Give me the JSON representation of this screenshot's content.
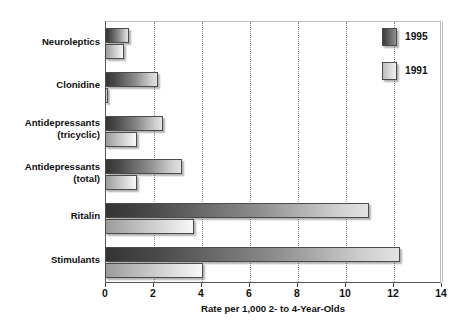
{
  "chart_data": {
    "type": "bar",
    "orientation": "horizontal",
    "title": "",
    "xlabel": "Rate per 1,000 2- to 4-Year-Olds",
    "ylabel": "",
    "xlim": [
      0,
      14
    ],
    "xticks": [
      0,
      2,
      4,
      6,
      8,
      10,
      12,
      14
    ],
    "xtick_labels": [
      "0",
      "2",
      "4",
      "6",
      "8",
      "10",
      "12",
      "14"
    ],
    "grid": "vertical dotted gridlines at each x tick",
    "legend_position": "top-right inside plot area",
    "categories": [
      "Neuroleptics",
      "Clonidine",
      "Antidepressants\n(tricyclic)",
      "Antidepressants\n(total)",
      "Ritalin",
      "Stimulants"
    ],
    "series": [
      {
        "name": "1995",
        "color": "#3a3a3a",
        "values": [
          1.0,
          2.2,
          2.4,
          3.2,
          11.0,
          12.3
        ]
      },
      {
        "name": "1991",
        "color": "#d0d0d0",
        "values": [
          0.8,
          0.1,
          1.35,
          1.35,
          3.7,
          4.1
        ]
      }
    ]
  },
  "axis": {
    "x_title": "Rate per 1,000 2- to 4-Year-Olds",
    "tick_labels": [
      "0",
      "2",
      "4",
      "6",
      "8",
      "10",
      "12",
      "14"
    ]
  },
  "legend": {
    "items": [
      {
        "label": "1995",
        "swatch": "dark-gradient-swatch"
      },
      {
        "label": "1991",
        "swatch": "light-gradient-swatch"
      }
    ]
  },
  "category_labels": [
    {
      "line1": "Neuroleptics",
      "line2": ""
    },
    {
      "line1": "Clonidine",
      "line2": ""
    },
    {
      "line1": "Antidepressants",
      "line2": "(tricyclic)"
    },
    {
      "line1": "Antidepressants",
      "line2": "(total)"
    },
    {
      "line1": "Ritalin",
      "line2": ""
    },
    {
      "line1": "Stimulants",
      "line2": ""
    }
  ],
  "edge_fragment": {
    "text": "y\ns\ns\n-\ny\n:\nl\ns"
  }
}
